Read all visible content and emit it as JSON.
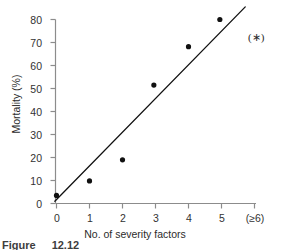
{
  "chart_data": {
    "type": "scatter",
    "title": "",
    "subtitle": "",
    "xlabel": "No. of severity factors",
    "ylabel": "Mortality (%)",
    "xlim": [
      0,
      6
    ],
    "ylim": [
      0,
      80
    ],
    "grid": false,
    "legend_position": "none",
    "x_tick_labels": [
      "0",
      "1",
      "2",
      "3",
      "4",
      "5",
      "(≥6)"
    ],
    "x_tick_values": [
      0,
      1,
      2,
      3,
      4,
      5,
      6
    ],
    "y_tick_labels": [
      "0",
      "10",
      "20",
      "30",
      "40",
      "50",
      "60",
      "70",
      "80"
    ],
    "y_tick_values": [
      0,
      10,
      20,
      30,
      40,
      50,
      60,
      70,
      80
    ],
    "points": [
      {
        "x": 0.0,
        "y": 3.5
      },
      {
        "x": 1.0,
        "y": 9.8
      },
      {
        "x": 2.0,
        "y": 19.0
      },
      {
        "x": 2.95,
        "y": 51.5
      },
      {
        "x": 4.0,
        "y": 68.2
      },
      {
        "x": 4.95,
        "y": 80.0
      }
    ],
    "marker": {
      "shape": "circle",
      "color": "#111111",
      "size_px": 5.2
    },
    "trend_line": {
      "type": "linear-fit",
      "color": "#111111",
      "width_px": 1.3,
      "x_start": -0.05,
      "y_start": 1.0,
      "x_end": 5.72,
      "y_end": 85.5
    },
    "annotations": [
      {
        "name": "significance-marker",
        "text": "(∗)",
        "x": 6.05,
        "y": 72.5
      }
    ],
    "axis_color": "#8c8c8c",
    "tick_color": "#8c8c8c",
    "text_color": "#2b2b2b"
  },
  "figure": {
    "caption_prefix": "Figure",
    "caption_number": "12.12"
  }
}
